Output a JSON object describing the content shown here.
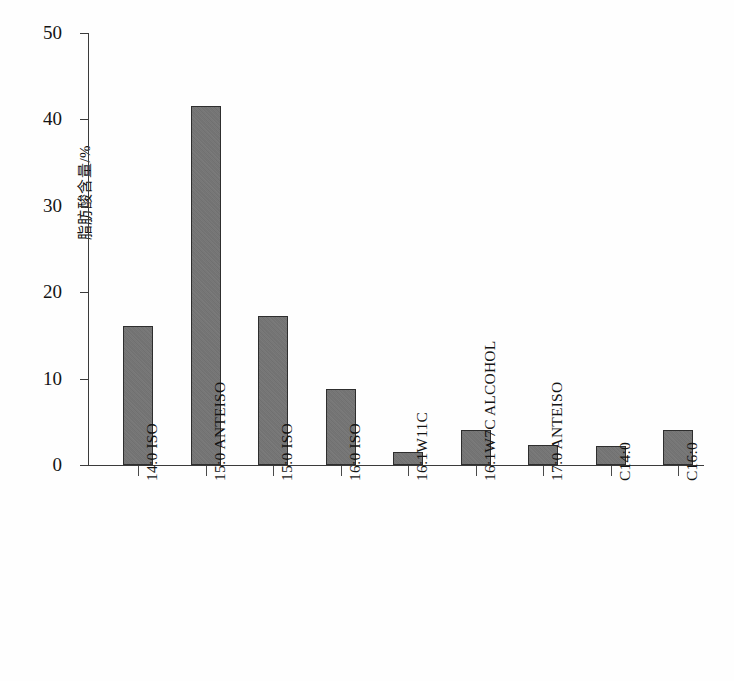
{
  "chart_data": {
    "type": "bar",
    "title": "",
    "xlabel": "",
    "ylabel": "脂肪酸含量/%",
    "ylim": [
      0,
      50
    ],
    "ytick_labels": [
      "0",
      "10",
      "20",
      "30",
      "40",
      "50"
    ],
    "yticks": [
      0,
      10,
      20,
      30,
      40,
      50
    ],
    "grid": false,
    "legend": null,
    "categories": [
      "14:0 ISO",
      "15:0 ANTEISO",
      "15:0 ISO",
      "16:0 ISO",
      "16:1W11C",
      "16:1W7C ALCOHOL",
      "17:0 ANTEISO",
      "C14:0",
      "C16:0"
    ],
    "values": [
      16.1,
      41.5,
      17.2,
      8.8,
      1.5,
      4.1,
      2.3,
      2.2,
      4.0
    ],
    "bar_color": "#757575",
    "bar_edge_color": "#2e2e2e",
    "axis_color": "#3b3b3b",
    "background_color": "#ffffff"
  }
}
